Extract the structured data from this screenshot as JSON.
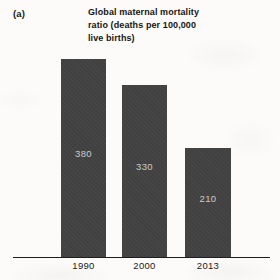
{
  "figure": {
    "panel_label": "(a)"
  },
  "chart_data": {
    "type": "bar",
    "title": "Global maternal mortality ratio (deaths per 100,000 live births)",
    "title_lines": [
      "Global maternal mortality",
      "ratio (deaths per 100,000",
      "live births)"
    ],
    "categories": [
      "1990",
      "2000",
      "2013"
    ],
    "values": [
      380,
      330,
      210
    ],
    "xlabel": "",
    "ylabel": "",
    "ylim": [
      0,
      380
    ],
    "grid": false,
    "legend": false,
    "value_labels_position": "inside-center",
    "colors": {
      "bar_fill": "#424242",
      "value_label": "#cccccc",
      "axis_line": "#1e1e1e",
      "tick_label": "#1a1a1a",
      "page_background": "#fcfbf9"
    }
  }
}
